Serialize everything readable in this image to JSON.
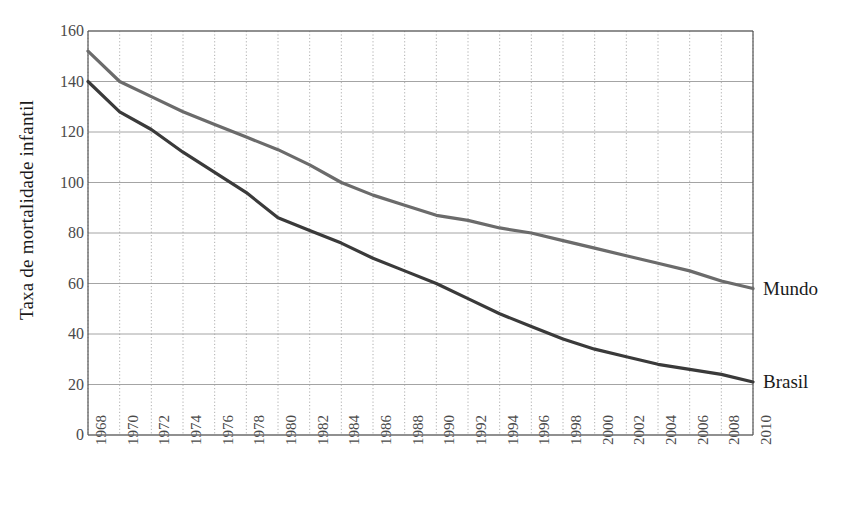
{
  "chart_data": {
    "type": "line",
    "title": "",
    "subtitle": "",
    "xlabel": "",
    "ylabel": "Taxa de mortalidade infantil",
    "x": [
      1968,
      1970,
      1972,
      1974,
      1976,
      1978,
      1980,
      1982,
      1984,
      1986,
      1988,
      1990,
      1992,
      1994,
      1996,
      1998,
      2000,
      2002,
      2004,
      2006,
      2008,
      2010
    ],
    "categories": [
      "1968",
      "1970",
      "1972",
      "1974",
      "1976",
      "1978",
      "1980",
      "1982",
      "1984",
      "1986",
      "1988",
      "1990",
      "1992",
      "1994",
      "1996",
      "1998",
      "2000",
      "2002",
      "2004",
      "2006",
      "2008",
      "2010"
    ],
    "series": [
      {
        "name": "Mundo",
        "color": "#6b6b6b",
        "values": [
          152,
          140,
          134,
          128,
          123,
          118,
          113,
          107,
          100,
          95,
          91,
          87,
          85,
          82,
          80,
          77,
          74,
          71,
          68,
          65,
          61,
          58
        ]
      },
      {
        "name": "Brasil",
        "color": "#3a3a3a",
        "values": [
          140,
          128,
          121,
          112,
          104,
          96,
          86,
          81,
          76,
          70,
          65,
          60,
          54,
          48,
          43,
          38,
          34,
          31,
          28,
          26,
          24,
          21
        ]
      }
    ],
    "ylim": [
      0,
      160
    ],
    "ytick_labels": [
      "0",
      "20",
      "40",
      "60",
      "80",
      "100",
      "120",
      "140",
      "160"
    ],
    "yticks": [
      0,
      20,
      40,
      60,
      80,
      100,
      120,
      140,
      160
    ],
    "xlim": [
      1968,
      2010
    ],
    "grid": {
      "horizontal": true,
      "vertical": true,
      "horizontal_style": "solid",
      "vertical_style": "dotted",
      "color": "#9a9a9a"
    },
    "legend_position": "inline-right-of-line-ends",
    "axis_color": "#555555",
    "background": "#ffffff"
  },
  "labels": {
    "series_mundo": "Mundo",
    "series_brasil": "Brasil",
    "y_axis_title": "Taxa de mortalidade infantil"
  }
}
